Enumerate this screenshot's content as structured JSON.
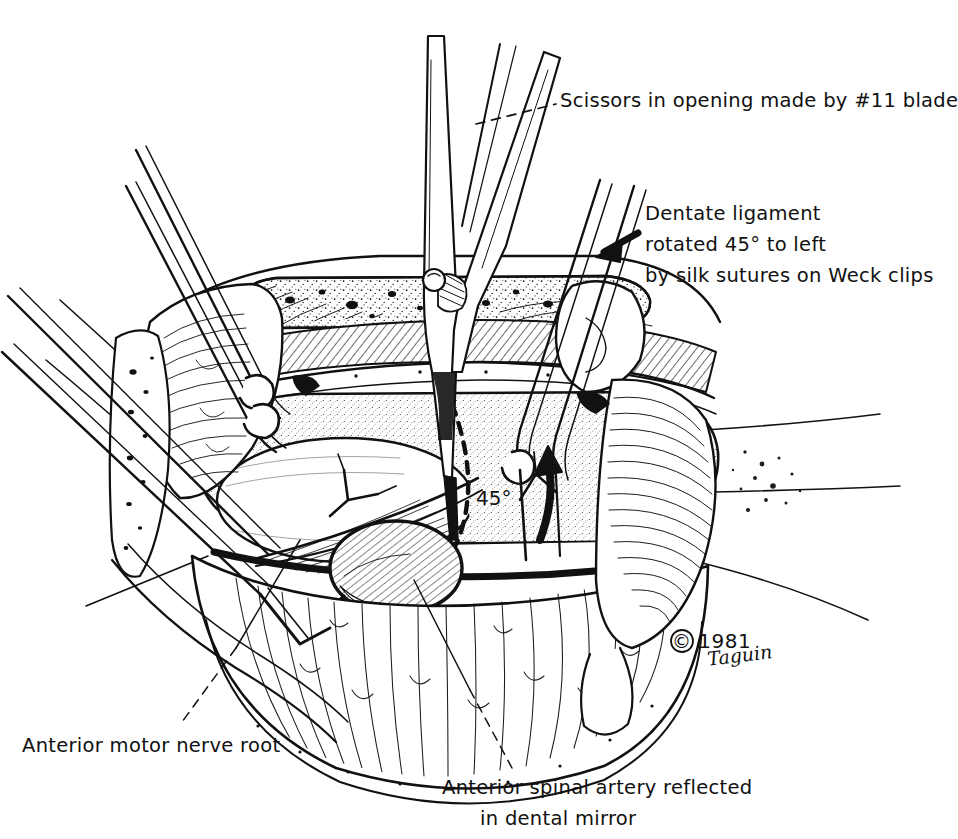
{
  "figure": {
    "background_color": "#ffffff",
    "ink_color": "#111111",
    "width": 952,
    "height": 839
  },
  "labels": {
    "scissors": "Scissors in opening made by #11 blade",
    "dentate_line1": "Dentate ligament",
    "dentate_line2": "rotated 45° to left",
    "dentate_line3": "by silk sutures on Weck clips",
    "nerve_root": "Anterior motor nerve root",
    "artery_line1": "Anterior spinal artery reflected",
    "artery_line2": "in dental mirror",
    "angle_in_figure": "45°"
  },
  "credit": {
    "symbol": "©",
    "year": "1981",
    "artist_signature": "Taguin"
  },
  "annotations": {
    "arrow_to_dentate": "solid-black-arrow-pointing-left",
    "curved_rotation_arrow": "curved-arrow-45-degrees",
    "leader_scissors": "dashed-leader-line",
    "leader_nerve_root": "dashed-leader-line",
    "leader_artery": "dashed-leader-line",
    "midline_incision": "dashed-vertical-line"
  },
  "instruments": {
    "center": "scissors",
    "left_upper": "forceps-with-suture",
    "left_lower": "retractor-needle",
    "right": "forceps-with-weck-clip",
    "mirror": "dental-mirror"
  }
}
